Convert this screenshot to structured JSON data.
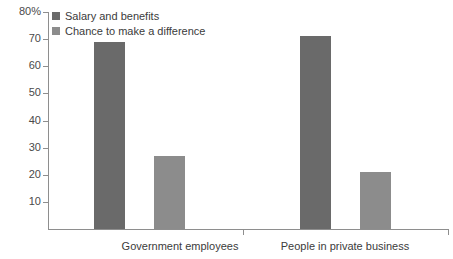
{
  "chart_data": {
    "type": "bar",
    "title": "",
    "subtitle": "",
    "xlabel": "",
    "ylabel": "",
    "categories": [
      "Government employees",
      "People in private business"
    ],
    "series": [
      {
        "name": "Salary and benefits",
        "values": [
          69,
          71
        ],
        "color": "#6a6a6a"
      },
      {
        "name": "Chance to make a difference",
        "values": [
          27,
          21
        ],
        "color": "#8c8c8c"
      }
    ],
    "ylim": [
      0,
      80
    ],
    "y_ticks": [
      {
        "value": 80,
        "label": "80%"
      },
      {
        "value": 70,
        "label": "70"
      },
      {
        "value": 60,
        "label": "60"
      },
      {
        "value": 50,
        "label": "50"
      },
      {
        "value": 40,
        "label": "40"
      },
      {
        "value": 30,
        "label": "30"
      },
      {
        "value": 20,
        "label": "20"
      },
      {
        "value": 10,
        "label": "10"
      }
    ],
    "grid": false,
    "legend_position": "top-left",
    "axis_color": "#8e8e8e",
    "background": "#ffffff"
  },
  "legend": {
    "items": [
      {
        "label": "Salary and benefits",
        "color": "#6a6a6a"
      },
      {
        "label": "Chance to make a difference",
        "color": "#8c8c8c"
      }
    ]
  },
  "y_axis": {
    "labels": [
      "80%",
      "70",
      "60",
      "50",
      "40",
      "30",
      "20",
      "10"
    ]
  },
  "x_axis": {
    "labels": [
      "Government employees",
      "People in private business"
    ]
  }
}
